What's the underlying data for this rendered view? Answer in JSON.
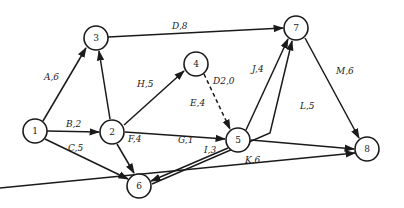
{
  "diagram": {
    "type": "activity-on-arrow network",
    "nodes": [
      {
        "id": "1",
        "label": "1",
        "x": 35,
        "y": 131
      },
      {
        "id": "2",
        "label": "2",
        "x": 112,
        "y": 132
      },
      {
        "id": "3",
        "label": "3",
        "x": 96,
        "y": 38
      },
      {
        "id": "4",
        "label": "4",
        "x": 196,
        "y": 64
      },
      {
        "id": "5",
        "label": "5",
        "x": 238,
        "y": 140
      },
      {
        "id": "6",
        "label": "6",
        "x": 139,
        "y": 186
      },
      {
        "id": "7",
        "label": "7",
        "x": 296,
        "y": 28
      },
      {
        "id": "8",
        "label": "8",
        "x": 367,
        "y": 149
      }
    ],
    "edges": [
      {
        "id": "A",
        "from": "1",
        "to": "3",
        "activity": "A",
        "duration": 6,
        "label": "A,6",
        "style": "solid"
      },
      {
        "id": "B",
        "from": "1",
        "to": "2",
        "activity": "B",
        "duration": 2,
        "label": "B,2",
        "style": "solid"
      },
      {
        "id": "C",
        "from": "1",
        "to": "6",
        "activity": "C",
        "duration": 5,
        "label": "C,5",
        "style": "solid"
      },
      {
        "id": "D",
        "from": "3",
        "to": "7",
        "activity": "D",
        "duration": 8,
        "label": "D,8",
        "style": "solid"
      },
      {
        "id": "23",
        "from": "2",
        "to": "3",
        "activity": "",
        "duration": null,
        "label": "",
        "style": "solid"
      },
      {
        "id": "H",
        "from": "2",
        "to": "4",
        "activity": "H",
        "duration": 5,
        "label": "H,5",
        "style": "solid"
      },
      {
        "id": "E",
        "from": "2",
        "to": "5",
        "activity": "E",
        "duration": 4,
        "label": "E,4",
        "style": "solid"
      },
      {
        "id": "F",
        "from": "2",
        "to": "6",
        "activity": "F",
        "duration": 4,
        "label": "F,4",
        "style": "solid"
      },
      {
        "id": "D2",
        "from": "4",
        "to": "5",
        "activity": "D2",
        "duration": 0,
        "label": "D2,0",
        "style": "dashed"
      },
      {
        "id": "J",
        "from": "5",
        "to": "7",
        "activity": "J",
        "duration": 4,
        "label": "J,4",
        "style": "solid"
      },
      {
        "id": "L",
        "from": "5",
        "to": "8",
        "activity": "L",
        "duration": 5,
        "label": "L,5",
        "style": "solid"
      },
      {
        "id": "G",
        "from": "5",
        "to": "6",
        "activity": "G",
        "duration": 1,
        "label": "G,1",
        "style": "solid"
      },
      {
        "id": "I",
        "from": "6",
        "to": "7",
        "activity": "I",
        "duration": 3,
        "label": "I,3",
        "style": "solid"
      },
      {
        "id": "K",
        "from": "6",
        "to": "8",
        "activity": "K",
        "duration": 6,
        "label": "K,6",
        "style": "solid"
      },
      {
        "id": "M",
        "from": "7",
        "to": "8",
        "activity": "M",
        "duration": 6,
        "label": "M,6",
        "style": "solid"
      }
    ],
    "edge_labels": {
      "A": "A,6",
      "B": "B,2",
      "C": "C,5",
      "D": "D,8",
      "H": "H,5",
      "E": "E,4",
      "F": "F,4",
      "D2": "D2,0",
      "J": "J,4",
      "L": "L,5",
      "G": "G,1",
      "I": "I,3",
      "K": "K,6",
      "M": "M,6"
    },
    "node_labels": {
      "n1": "1",
      "n2": "2",
      "n3": "3",
      "n4": "4",
      "n5": "5",
      "n6": "6",
      "n7": "7",
      "n8": "8"
    },
    "colors": {
      "stroke": "#1a1a1a",
      "background": "#ffffff"
    }
  }
}
